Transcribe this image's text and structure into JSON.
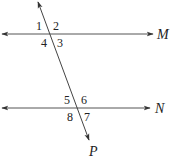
{
  "diagram": {
    "type": "parallel-lines-transversal",
    "colors": {
      "line": "#444444",
      "text": "#222222",
      "background": "#ffffff"
    },
    "lines": {
      "M": {
        "label": "M",
        "y": 34,
        "x1": 2,
        "x2": 153
      },
      "N": {
        "label": "N",
        "y": 108,
        "x1": 2,
        "x2": 150
      },
      "P": {
        "label": "P",
        "x1": 38,
        "y1": 2,
        "x2": 89,
        "y2": 140
      }
    },
    "angles": {
      "a1": "1",
      "a2": "2",
      "a3": "3",
      "a4": "4",
      "a5": "5",
      "a6": "6",
      "a7": "7",
      "a8": "8"
    }
  }
}
